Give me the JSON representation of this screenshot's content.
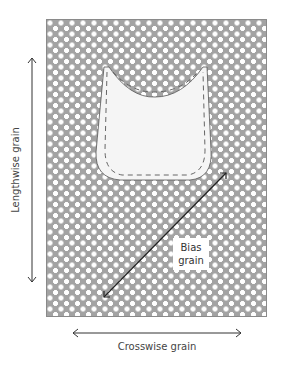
{
  "diagram": {
    "type": "fabric grainline diagram",
    "fabric": {
      "pattern": "white polka dots on gray",
      "bg_color": "#a3a3a3",
      "dot_color": "#ffffff"
    },
    "pattern_piece": {
      "shape": "bodice/neckline piece",
      "fill": "#f4f4f4",
      "stitch_marks": "dashed pin marks along edge"
    },
    "labels": {
      "lengthwise": "Lengthwise grain",
      "crosswise": "Crosswise grain",
      "bias_line1": "Bias",
      "bias_line2": "grain"
    },
    "arrows": [
      {
        "name": "lengthwise",
        "orientation": "vertical",
        "double_headed": true
      },
      {
        "name": "crosswise",
        "orientation": "horizontal",
        "double_headed": true
      },
      {
        "name": "bias",
        "orientation": "diagonal",
        "double_headed": true
      }
    ]
  }
}
